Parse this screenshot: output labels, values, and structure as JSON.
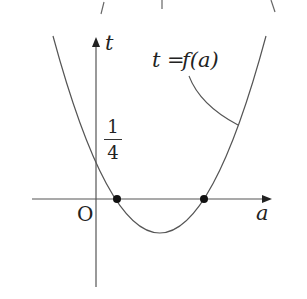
{
  "figure": {
    "curve_label": "t = f(a)",
    "curve_label_parts": {
      "lhs": "t",
      "eq": "=",
      "rhs": "f(a)"
    },
    "vertical_axis_label": "t",
    "horizontal_axis_label": "a",
    "origin_label": "O",
    "y_intercept_label": {
      "numerator": "1",
      "denominator": "4"
    },
    "colors": {
      "stroke": "#555555",
      "text": "#222222",
      "point": "#111111"
    }
  },
  "diagram": {
    "type": "function-graph",
    "curve": "upward parabola t = f(a)",
    "y_intercept": "1/4",
    "marked_points": [
      "left root on a-axis (positive a)",
      "right root on a-axis (positive a)"
    ],
    "vertex": "below a-axis, between the two roots"
  }
}
